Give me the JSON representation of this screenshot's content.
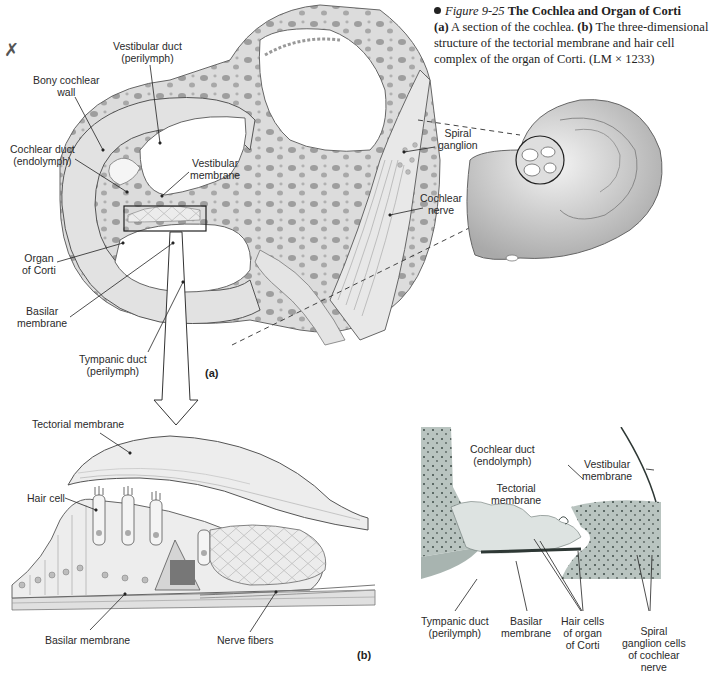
{
  "caption": {
    "figure_number": "Figure 9-25",
    "title": "The Cochlea and Organ of Corti",
    "part_a_tag": "(a)",
    "part_a_text": "A section of the cochlea.",
    "part_b_tag": "(b)",
    "part_b_text": "The three-dimensional structure of the tectorial membrane and hair cell complex of the organ of Corti. (LM × 1233)"
  },
  "corner_mark": "✗",
  "panel_a": {
    "tag": "(a)",
    "labels": {
      "vestibular_duct": [
        "Vestibular duct",
        "(perilymph)"
      ],
      "bony_cochlear_wall": [
        "Bony cochlear",
        "wall"
      ],
      "cochlear_duct": [
        "Cochlear duct",
        "(endolymph)"
      ],
      "vestibular_membrane": [
        "Vestibular",
        "membrane"
      ],
      "organ_of_corti": [
        "Organ",
        "of Corti"
      ],
      "basilar_membrane": [
        "Basilar",
        "membrane"
      ],
      "tympanic_duct": [
        "Tympanic duct",
        "(perilymph)"
      ],
      "spiral_ganglion": [
        "Spiral",
        "ganglion"
      ],
      "cochlear_nerve": [
        "Cochlear",
        "nerve"
      ]
    }
  },
  "panel_b": {
    "tag": "(b)",
    "labels": {
      "tectorial_membrane": "Tectorial membrane",
      "hair_cell": "Hair cell",
      "basilar_membrane": "Basilar membrane",
      "nerve_fibers": "Nerve fibers"
    }
  },
  "micrograph": {
    "labels": {
      "cochlear_duct": [
        "Cochlear duct",
        "(endolymph)"
      ],
      "vestibular_membrane": [
        "Vestibular",
        "membrane"
      ],
      "tectorial_membrane": [
        "Tectorial",
        "membrane"
      ],
      "tympanic_duct": [
        "Tympanic duct",
        "(perilymph)"
      ],
      "basilar_membrane": [
        "Basilar",
        "membrane"
      ],
      "hair_cells": [
        "Hair cells",
        "of organ",
        "of Corti"
      ],
      "spiral_ganglion_cells": [
        "Spiral",
        "ganglion cells",
        "of cochlear",
        "nerve"
      ]
    }
  },
  "colors": {
    "bone": "#d9d9d9",
    "bone_dark": "#9a9a9a",
    "duct": "#ffffff",
    "tissue_stain": "#8a9a94",
    "tissue_light": "#c8d2ce"
  }
}
